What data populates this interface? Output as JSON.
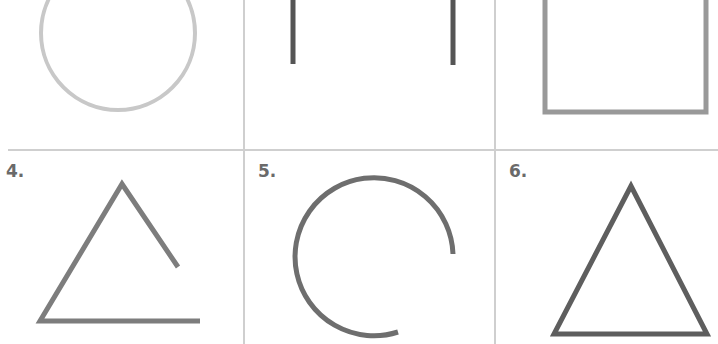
{
  "worksheet": {
    "cells": [
      {
        "index": 1,
        "label": "",
        "shape": "circle",
        "closed": true,
        "color": "#c8c8c8"
      },
      {
        "index": 2,
        "label": "",
        "shape": "two-vertical-lines",
        "closed": false,
        "color": "#555555"
      },
      {
        "index": 3,
        "label": "",
        "shape": "rectangle",
        "closed": true,
        "color": "#999999"
      },
      {
        "index": 4,
        "label": "4.",
        "shape": "triangle",
        "closed": false,
        "color": "#7d7d7d"
      },
      {
        "index": 5,
        "label": "5.",
        "shape": "circle",
        "closed": false,
        "color": "#6e6e6e"
      },
      {
        "index": 6,
        "label": "6.",
        "shape": "triangle",
        "closed": true,
        "color": "#5e5e5e"
      }
    ],
    "grid_color": "#cfcfcf"
  }
}
